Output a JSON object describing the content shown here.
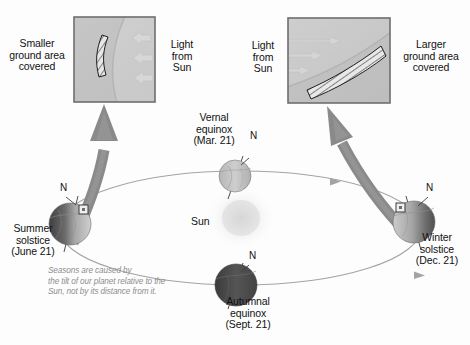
{
  "figure": {
    "background_color": "#fdfdfd",
    "sun_label": "Sun",
    "caption": "Seasons are caused by\nthe tilt of our planet relative to the\nSun, not by its distance from it.",
    "caption_color": "#8d8d8d"
  },
  "insets": {
    "left": {
      "panel_name": "smaller-ground-area-panel",
      "left_label": "Smaller\nground area\ncovered",
      "right_label": "Light\nfrom\nSun",
      "beam_count": 3,
      "beam_direction": "left",
      "band_width": "narrow",
      "border_color": "#6e6e6e",
      "fill_color": "#c9c9c9"
    },
    "right": {
      "panel_name": "larger-ground-area-panel",
      "left_label": "Light\nfrom\nSun",
      "right_label": "Larger\nground area\ncovered",
      "beam_count": 3,
      "beam_direction": "right",
      "band_width": "wide",
      "border_color": "#6e6e6e",
      "fill_color": "#c9c9c9"
    }
  },
  "orbit": {
    "stroke_color": "#9a9a9a",
    "direction_markers": 3
  },
  "positions": [
    {
      "id": "summer-solstice",
      "label": "Summer\nsolstice\n(June 21)",
      "pole_label": "N",
      "lit_side": "right",
      "marker": "square",
      "x": 70,
      "y": 224
    },
    {
      "id": "vernal-equinox",
      "label": "Vernal\nequinox\n(Mar. 21)",
      "pole_label": "N",
      "lit_side": "full",
      "marker": "none",
      "x": 235,
      "y": 176
    },
    {
      "id": "winter-solstice",
      "label": "Winter\nsolstice\n(Dec. 21)",
      "pole_label": "N",
      "lit_side": "left",
      "marker": "square",
      "x": 414,
      "y": 222
    },
    {
      "id": "autumnal-equinox",
      "label": "Autumnal\nequinox\n(Sept. 21)",
      "pole_label": "N",
      "lit_side": "none",
      "marker": "none",
      "x": 236,
      "y": 285
    }
  ],
  "callout_arrows": [
    {
      "id": "summer-callout-arrow",
      "from": "summer-solstice",
      "to": "left-panel"
    },
    {
      "id": "winter-callout-arrow",
      "from": "winter-solstice",
      "to": "right-panel"
    }
  ],
  "colors": {
    "globe_dark": "#4a4a4a",
    "globe_light": "#c2c2c2",
    "arrow_gray": "#7d7d7d",
    "sun_glow": "#d8d8d8"
  }
}
